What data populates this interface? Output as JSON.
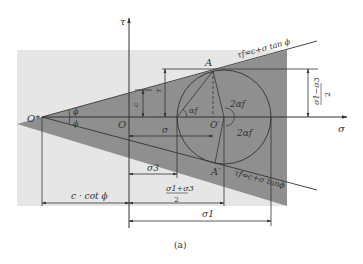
{
  "figure": {
    "caption": "(a)",
    "axes": {
      "x_label": "σ",
      "y_label": "τ"
    },
    "points": {
      "origin": "O",
      "apex": "O*",
      "center": "O′",
      "tangent_top": "A",
      "tangent_bottom": "A′"
    },
    "lines": {
      "upper_envelope": "τf=c+σ tan ϕ",
      "lower_envelope": "τf=c+σ tanϕ"
    },
    "angles": {
      "phi_upper": "ϕ",
      "phi_lower": "ϕ",
      "alpha": "αf",
      "two_alpha_upper": "2αf",
      "two_alpha_lower": "2αf"
    },
    "dimensions": {
      "c": "c",
      "tau": "τ",
      "sigma": "σ",
      "sigma3": "σ3",
      "half_sum_num": "σ1+σ3",
      "half_sum_den": "2",
      "half_diff_num": "σ1−σ3",
      "half_diff_den": "2",
      "c_cot_phi": "c · cot ϕ",
      "sigma1": "σ1"
    },
    "colors": {
      "light_region": "#e6e6e6",
      "dark_region": "#8a8a8a",
      "line": "#333333"
    }
  }
}
